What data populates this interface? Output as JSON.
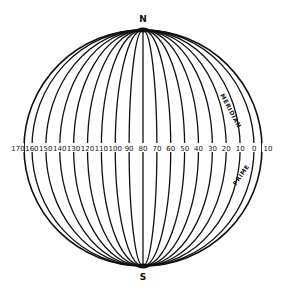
{
  "diagram": {
    "north_label": "N",
    "south_label": "S",
    "prime_label_top": "MERIDIAN",
    "prime_label_bottom": "PRIME",
    "longitude_labels": [
      "170",
      "160",
      "150",
      "140",
      "130",
      "120",
      "110",
      "100",
      "90",
      "80",
      "70",
      "60",
      "50",
      "40",
      "30",
      "20",
      "10",
      "0",
      "10"
    ],
    "line_color": "#111111",
    "background": "#ffffff"
  }
}
